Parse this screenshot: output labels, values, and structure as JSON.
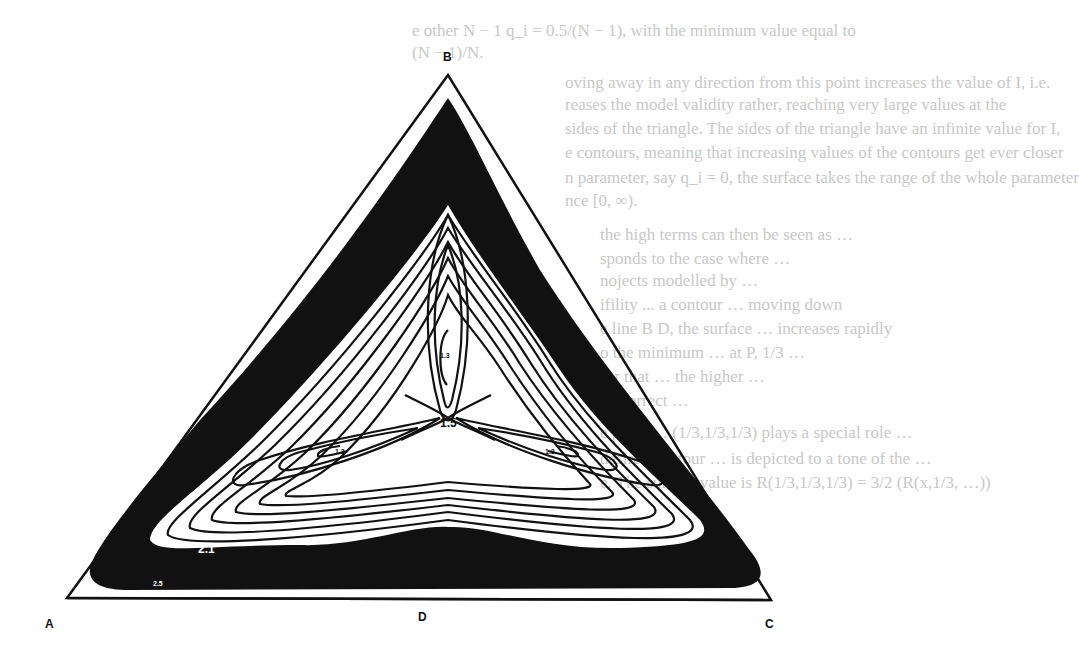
{
  "page": {
    "type": "scanned book page with contour figure over show-through text",
    "background": "#ffffff",
    "ink": "#111111",
    "bleed_color": "#c8c8c8"
  },
  "bleed_text": {
    "lines": [
      "e other N − 1 q_i = 0.5/(N − 1), with the minimum value equal to",
      "(N − 1)/N.",
      "oving away in any direction from this point increases the value of I, i.e.",
      "reases the model validity rather, reaching very large values at the",
      "sides of the triangle. The sides of the triangle have an infinite value for I,",
      "e contours, meaning that increasing values of the contours get ever closer",
      "n parameter, say q_i = 0, the surface takes the range of the whole parameter",
      "nce [0, ∞).",
      "the high terms can then be seen as …",
      "sponds to the case where …",
      "nojects modelled by …",
      "ifility ... a contour …  moving down",
      "e line B D, the surface … increases rapidly",
      "o the minimum … at P, 1/3 …",
      "for that … the higher …",
      "ne correct …",
      "e point … (1/3,1/3,1/3) plays a special role …",
      "desired contour … is depicted to a tone of the …",
      "e. The surface value is R(1/3,1/3,1/3) = 3/2 (R(x,1/3, …))"
    ]
  },
  "figure": {
    "type": "ternary contour plot",
    "vertices": {
      "top": "B",
      "bottom_left": "A",
      "bottom_right": "C",
      "bottom_mid": "D"
    },
    "contour_labels": [
      {
        "text": "1.5",
        "position": "centre saddle point"
      },
      {
        "text": "1.3",
        "position": "upper lobe minimum"
      },
      {
        "text": "1.3",
        "position": "left lobe minimum"
      },
      {
        "text": "1.3",
        "position": "right lobe minimum"
      },
      {
        "text": "2.1",
        "position": "lower-left contour"
      },
      {
        "text": "2.5",
        "position": "lower-left outer contour"
      }
    ]
  }
}
